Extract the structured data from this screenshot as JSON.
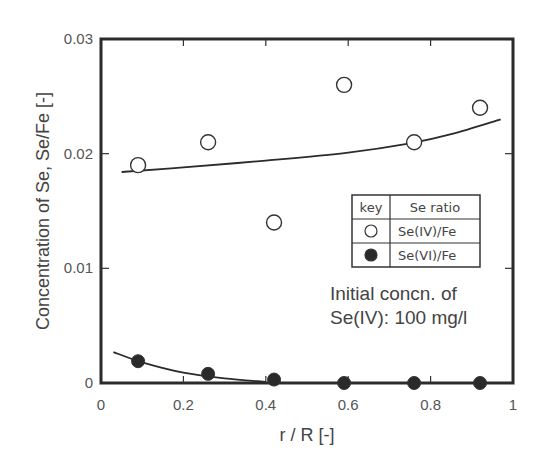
{
  "chart_data": {
    "type": "scatter",
    "title": "",
    "xlabel": "r / R [-]",
    "ylabel": "Concentration of Se, Se/Fe [-]",
    "xlim": [
      0,
      1
    ],
    "ylim": [
      0,
      0.03
    ],
    "x_ticks": [
      "0",
      "0.2",
      "0.4",
      "0.6",
      "0.8",
      "1"
    ],
    "y_ticks": [
      "0",
      "0.01",
      "0.02",
      "0.03"
    ],
    "grid": false,
    "legend": {
      "position": "inside right",
      "header": [
        "key",
        "Se ratio"
      ],
      "entries": [
        {
          "marker": "open-circle",
          "label": "Se(IV)/Fe"
        },
        {
          "marker": "filled-circle",
          "label": "Se(VI)/Fe"
        }
      ]
    },
    "annotation": [
      "Initial concn. of",
      "Se(IV): 100 mg/l"
    ],
    "series": [
      {
        "name": "Se(IV)/Fe",
        "marker": "open-circle",
        "x": [
          0.09,
          0.26,
          0.42,
          0.59,
          0.76,
          0.92
        ],
        "y": [
          0.019,
          0.021,
          0.014,
          0.026,
          0.021,
          0.024
        ],
        "fit_curve": {
          "x": [
            0.05,
            0.2,
            0.4,
            0.6,
            0.75,
            0.85,
            0.97
          ],
          "y": [
            0.0184,
            0.0188,
            0.0194,
            0.0201,
            0.0209,
            0.0217,
            0.023
          ]
        }
      },
      {
        "name": "Se(VI)/Fe",
        "marker": "filled-circle",
        "x": [
          0.09,
          0.26,
          0.42,
          0.59,
          0.76,
          0.92
        ],
        "y": [
          0.0019,
          0.0008,
          0.0003,
          0.0,
          0.0,
          0.0
        ],
        "fit_curve": {
          "x": [
            0.03,
            0.1,
            0.2,
            0.3,
            0.4
          ],
          "y": [
            0.0027,
            0.0018,
            0.0009,
            0.0004,
            0.0001
          ]
        }
      }
    ]
  }
}
